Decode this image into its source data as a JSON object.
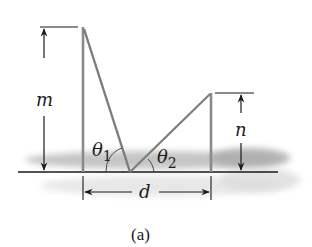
{
  "figure": {
    "caption": "(a)",
    "labels": {
      "m": "m",
      "n": "n",
      "d": "d",
      "theta1": "θ",
      "theta1_sub": "1",
      "theta2": "θ",
      "theta2_sub": "2"
    },
    "colors": {
      "ink": "#1a1a1a",
      "pole": "#8a8a8a",
      "ray": "#7d7d7d",
      "ground_shade": "#b9b9b9",
      "background": "#ffffff"
    }
  }
}
